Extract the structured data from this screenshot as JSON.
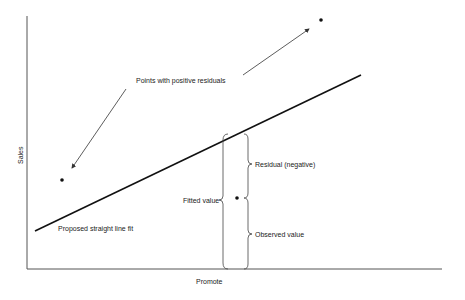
{
  "diagram": {
    "axes": {
      "x_label": "Promote",
      "y_label": "Sales"
    },
    "labels": {
      "positive_residuals": "Points with positive residuals",
      "fit_line": "Proposed straight line fit",
      "fitted_value": "Fitted value",
      "residual_negative": "Residual (negative)",
      "observed_value": "Observed value"
    },
    "elements": {
      "fit_line": {
        "from": [
          35,
          231
        ],
        "to": [
          361,
          75
        ]
      },
      "points": [
        {
          "id": "point-positive-left",
          "x": 62,
          "y": 180
        },
        {
          "id": "point-positive-right",
          "x": 321,
          "y": 20
        },
        {
          "id": "point-negative-residual",
          "x": 237,
          "y": 198
        }
      ],
      "arrows": [
        {
          "id": "arrow-to-left-point",
          "from": [
            126,
            89
          ],
          "to": [
            72,
            168
          ]
        },
        {
          "id": "arrow-to-right-point",
          "from": [
            243,
            75
          ],
          "to": [
            309,
            29
          ]
        }
      ]
    },
    "colors": {
      "line": "#111111",
      "axis": "#555555",
      "text": "#222222",
      "background": "#ffffff"
    }
  }
}
